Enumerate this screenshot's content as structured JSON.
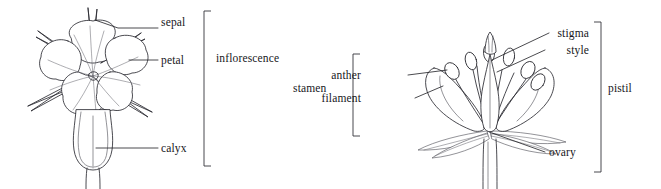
{
  "figure": {
    "background_color": "#ffffff",
    "ink_color": "#2b2b31",
    "text_color": "#17171b"
  },
  "left_diagram": {
    "name": "whole flower with calyx",
    "bracket_label": "inflorescence",
    "labels": [
      {
        "key": "sepal",
        "text": "sepal"
      },
      {
        "key": "petal",
        "text": "petal"
      },
      {
        "key": "calyx",
        "text": "calyx"
      }
    ]
  },
  "right_diagram": {
    "name": "flower cross section",
    "bracket_label_left": "stamen",
    "bracket_label_right": "pistil",
    "labels": [
      {
        "key": "anther",
        "text": "anther"
      },
      {
        "key": "filament",
        "text": "filament"
      },
      {
        "key": "stigma",
        "text": "stigma"
      },
      {
        "key": "style",
        "text": "style"
      },
      {
        "key": "ovary",
        "text": "ovary"
      }
    ]
  }
}
